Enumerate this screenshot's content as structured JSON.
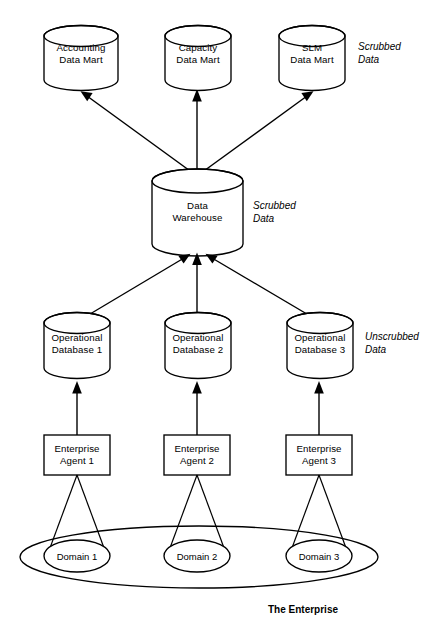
{
  "diagram": {
    "colors": {
      "stroke": "#000000",
      "fill": "#ffffff",
      "background": "#ffffff"
    },
    "data_marts": [
      {
        "line1": "Accounting",
        "line2": "Data Mart"
      },
      {
        "line1": "Capacity",
        "line2": "Data Mart"
      },
      {
        "line1": "SLM",
        "line2": "Data Mart"
      }
    ],
    "warehouse": {
      "line1": "Data",
      "line2": "Warehouse"
    },
    "operational_databases": [
      {
        "line1": "Operational",
        "line2": "Database 1"
      },
      {
        "line1": "Operational",
        "line2": "Database 2"
      },
      {
        "line1": "Operational",
        "line2": "Database 3"
      }
    ],
    "agents": [
      {
        "line1": "Enterprise",
        "line2": "Agent 1"
      },
      {
        "line1": "Enterprise",
        "line2": "Agent 2"
      },
      {
        "line1": "Enterprise",
        "line2": "Agent 3"
      }
    ],
    "domains": [
      {
        "label": "Domain 1"
      },
      {
        "label": "Domain 2"
      },
      {
        "label": "Domain 3"
      }
    ],
    "annotations": {
      "marts_data_state_line1": "Scrubbed",
      "marts_data_state_line2": "Data",
      "warehouse_data_state_line1": "Scrubbed",
      "warehouse_data_state_line2": "Data",
      "operational_data_state_line1": "Unscrubbed",
      "operational_data_state_line2": "Data",
      "enterprise_boundary": "The Enterprise"
    }
  }
}
